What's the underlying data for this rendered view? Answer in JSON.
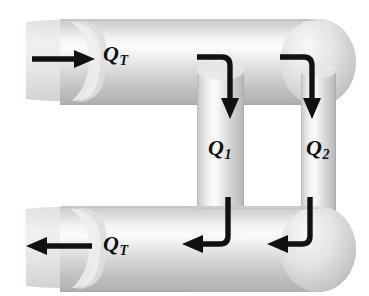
{
  "figure": {
    "type": "schematic-diagram",
    "background_color": "#ffffff",
    "pipe_color_light": "#f2f2f2",
    "pipe_color_mid": "#d2d2d2",
    "pipe_color_dark": "#a8a8a8",
    "arrow_color": "#111111"
  },
  "labels": {
    "inlet": {
      "base": "Q",
      "sub": "T",
      "full": "QT"
    },
    "outlet": {
      "base": "Q",
      "sub": "T",
      "full": "QT"
    },
    "branch1": {
      "base": "Q",
      "sub": "1",
      "full": "Q1"
    },
    "branch2": {
      "base": "Q",
      "sub": "2",
      "full": "Q2"
    }
  },
  "arrows": [
    {
      "name": "inlet-arrow",
      "direction": "right",
      "label": "QT"
    },
    {
      "name": "outlet-arrow",
      "direction": "left",
      "label": "QT"
    },
    {
      "name": "branch1-down-arrow",
      "direction": "down",
      "label": "Q1"
    },
    {
      "name": "branch2-down-arrow",
      "direction": "down",
      "label": "Q2"
    },
    {
      "name": "branch1-exit-arrow",
      "direction": "left",
      "label": "Q1"
    },
    {
      "name": "branch2-exit-arrow",
      "direction": "left",
      "label": "Q2"
    }
  ],
  "pipes": [
    {
      "name": "top-header-pipe",
      "orientation": "horizontal"
    },
    {
      "name": "bottom-header-pipe",
      "orientation": "horizontal"
    },
    {
      "name": "branch-pipe-1",
      "orientation": "vertical"
    },
    {
      "name": "branch-pipe-2",
      "orientation": "vertical"
    }
  ]
}
